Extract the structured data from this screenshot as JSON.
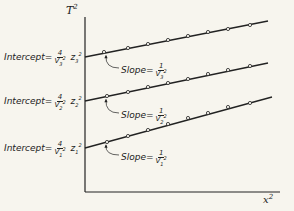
{
  "chart_data": {
    "type": "line",
    "title": "",
    "xlabel": "x²",
    "ylabel": "T²",
    "grid": false,
    "legend": null,
    "series": [
      {
        "name": "line-3",
        "intercept_label": {
          "prefix": "Intercept",
          "num": "4",
          "den": "V",
          "den_sub": "3",
          "den_sup": "2",
          "factor": "z",
          "factor_sub": "3",
          "factor_sup": "2"
        },
        "slope_label": {
          "prefix": "Slope",
          "num": "1",
          "den": "V",
          "den_sub": "3",
          "den_sup": "2"
        },
        "line": {
          "x1": 85,
          "y1": 57,
          "x2": 268,
          "y2": 21
        },
        "points": [
          [
            104,
            52
          ],
          [
            128,
            48
          ],
          [
            148,
            44
          ],
          [
            168,
            40
          ],
          [
            188,
            36
          ],
          [
            208,
            32
          ],
          [
            228,
            29
          ],
          [
            250,
            25
          ]
        ]
      },
      {
        "name": "line-2",
        "intercept_label": {
          "prefix": "Intercept",
          "num": "4",
          "den": "V",
          "den_sub": "2",
          "den_sup": "2",
          "factor": "z",
          "factor_sub": "2",
          "factor_sup": "2"
        },
        "slope_label": {
          "prefix": "Slope",
          "num": "1",
          "den": "V",
          "den_sub": "2",
          "den_sup": "2"
        },
        "line": {
          "x1": 85,
          "y1": 101,
          "x2": 268,
          "y2": 63
        },
        "points": [
          [
            107,
            96
          ],
          [
            128,
            92
          ],
          [
            148,
            87
          ],
          [
            168,
            83
          ],
          [
            188,
            79
          ],
          [
            208,
            74
          ],
          [
            228,
            70
          ],
          [
            250,
            66
          ]
        ]
      },
      {
        "name": "line-1",
        "intercept_label": {
          "prefix": "Intercept",
          "num": "4",
          "den": "V",
          "den_sub": "1",
          "den_sup": "2",
          "factor": "z",
          "factor_sub": "1",
          "factor_sup": "2"
        },
        "slope_label": {
          "prefix": "Slope",
          "num": "1",
          "den": "V",
          "den_sub": "1",
          "den_sup": "2"
        },
        "line": {
          "x1": 85,
          "y1": 148,
          "x2": 272,
          "y2": 97
        },
        "points": [
          [
            107,
            142
          ],
          [
            128,
            136
          ],
          [
            148,
            130
          ],
          [
            168,
            124
          ],
          [
            188,
            118
          ],
          [
            208,
            113
          ],
          [
            228,
            107
          ],
          [
            250,
            103
          ]
        ]
      }
    ],
    "axes": {
      "origin": [
        85,
        192
      ],
      "y_top": 17,
      "x_right": 280
    }
  },
  "labels": {
    "y_axis": "T",
    "y_axis_sup": "2",
    "x_axis": "x",
    "x_axis_sup": "2",
    "eq": "=",
    "intercept_prefix": "Intercept",
    "slope_prefix": "Slope"
  },
  "colors": {
    "ink": "#222222",
    "paper": "#f7f5ee"
  }
}
